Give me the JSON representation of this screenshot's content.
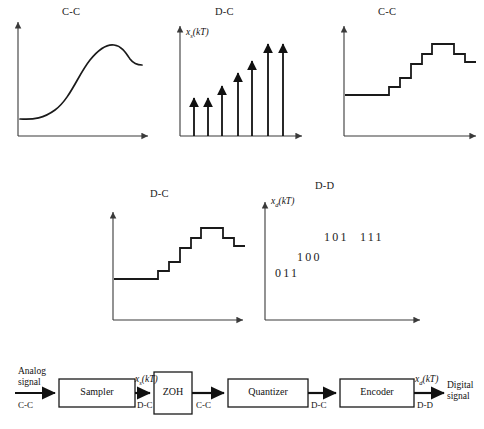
{
  "figure": {
    "plots": [
      {
        "id": "plot-analog",
        "title": "C-C",
        "title_x": 62,
        "title_y": 6,
        "ylabel": "",
        "type": "continuous-curve",
        "axes": {
          "ox": 18,
          "oy": 136,
          "top": 18,
          "right": 152
        }
      },
      {
        "id": "plot-sampled",
        "title": "D-C",
        "title_x": 215,
        "title_y": 6,
        "ylabel": "x",
        "ylabel_sub": "s",
        "ylabel_arg": "(kT)",
        "type": "impulse-train",
        "axes": {
          "ox": 180,
          "oy": 136,
          "top": 22,
          "right": 305
        }
      },
      {
        "id": "plot-zoh",
        "title": "C-C",
        "title_x": 378,
        "title_y": 6,
        "ylabel": "",
        "type": "staircase",
        "axes": {
          "ox": 344,
          "oy": 136,
          "top": 22,
          "right": 478
        }
      },
      {
        "id": "plot-quantized",
        "title": "D-C",
        "title_x": 150,
        "title_y": 188,
        "ylabel": "",
        "type": "staircase",
        "axes": {
          "ox": 113,
          "oy": 320,
          "top": 208,
          "right": 245
        }
      },
      {
        "id": "plot-encoded",
        "title": "D-D",
        "title_x": 315,
        "title_y": 180,
        "ylabel": "x",
        "ylabel_sub": "d",
        "ylabel_arg": "(kT)",
        "type": "binary-codes",
        "axes": {
          "ox": 265,
          "oy": 320,
          "top": 198,
          "right": 422
        }
      }
    ],
    "code_words": [
      {
        "text": "011",
        "x": 275,
        "y": 272
      },
      {
        "text": "100",
        "x": 297,
        "y": 256
      },
      {
        "text": "101",
        "x": 324,
        "y": 236
      },
      {
        "text": "111",
        "x": 360,
        "y": 236
      }
    ],
    "impulse_heights": [
      38,
      38,
      50,
      63,
      75,
      92,
      92
    ],
    "impulse_x": [
      194,
      208,
      222,
      238,
      252,
      268,
      283
    ]
  },
  "block_diagram": {
    "input": {
      "line1": "Analog",
      "line2": "signal",
      "x": 18,
      "y": 366
    },
    "output": {
      "line1": "Digital",
      "line2": "signal",
      "x": 447,
      "y": 380
    },
    "blocks": [
      {
        "name": "Sampler",
        "x": 59,
        "y": 379,
        "w": 76,
        "h": 28
      },
      {
        "name": "ZOH",
        "x": 154,
        "y": 372,
        "w": 38,
        "h": 42
      },
      {
        "name": "Quantizer",
        "x": 228,
        "y": 379,
        "w": 80,
        "h": 28
      },
      {
        "name": "Encoder",
        "x": 340,
        "y": 379,
        "w": 74,
        "h": 28
      }
    ],
    "signal_labels": [
      {
        "text": "x",
        "sub": "s",
        "arg": "(kT)",
        "x": 135,
        "y": 376,
        "italic": true
      },
      {
        "text": "x",
        "sub": "d",
        "arg": "(kT)",
        "x": 415,
        "y": 376,
        "italic": true
      }
    ],
    "type_labels": [
      {
        "text": "C-C",
        "x": 18,
        "y": 404
      },
      {
        "text": "D-C",
        "x": 137,
        "y": 404
      },
      {
        "text": "C-C",
        "x": 196,
        "y": 404
      },
      {
        "text": "D-C",
        "x": 311,
        "y": 404
      },
      {
        "text": "D-D",
        "x": 417,
        "y": 404
      }
    ]
  },
  "colors": {
    "ink": "#1a1a1a",
    "axis": "#3a3a3a",
    "background": "#ffffff"
  }
}
